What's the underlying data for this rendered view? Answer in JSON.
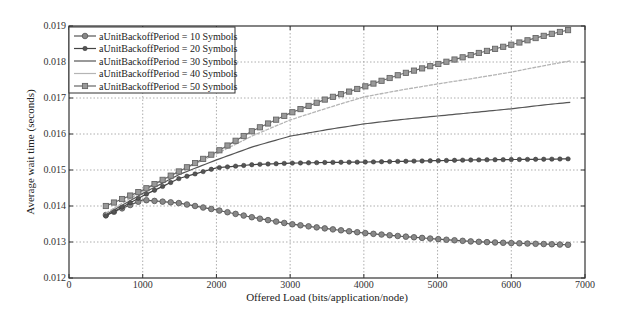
{
  "chart_data": {
    "type": "line",
    "title": "",
    "xlabel": "Offered Load (bits/application/node)",
    "ylabel": "Average wait time (seconds)",
    "xlim": [
      0,
      7000
    ],
    "ylim": [
      0.012,
      0.019
    ],
    "xticks": [
      "0",
      "1000",
      "2000",
      "3000",
      "4000",
      "5000",
      "6000",
      "7000"
    ],
    "yticks": [
      "0.012",
      "0.013",
      "0.014",
      "0.015",
      "0.016",
      "0.017",
      "0.018",
      "0.019"
    ],
    "grid": true,
    "legend_position": "top-left",
    "x": [
      500,
      1000,
      1500,
      2000,
      2500,
      3000,
      3500,
      4000,
      4500,
      5000,
      5500,
      6000,
      6500,
      6800
    ],
    "series": [
      {
        "name": "aUnitBackoffPeriod = 10 Symbols",
        "marker": "circle",
        "color": "#555555",
        "values": [
          0.01375,
          0.01417,
          0.01408,
          0.01389,
          0.01368,
          0.0135,
          0.01337,
          0.01325,
          0.01316,
          0.01308,
          0.01301,
          0.01297,
          0.01294,
          0.01292
        ]
      },
      {
        "name": "aUnitBackoffPeriod = 20 Symbols",
        "marker": "dot",
        "color": "#444444",
        "values": [
          0.01372,
          0.01428,
          0.01477,
          0.01506,
          0.01515,
          0.01519,
          0.01521,
          0.01522,
          0.01524,
          0.01526,
          0.01528,
          0.01529,
          0.0153,
          0.01531
        ]
      },
      {
        "name": "aUnitBackoffPeriod = 30 Symbols",
        "marker": "none",
        "color": "#555555",
        "values": [
          0.01376,
          0.01435,
          0.01488,
          0.01528,
          0.01565,
          0.01594,
          0.01612,
          0.01628,
          0.0164,
          0.0165,
          0.0166,
          0.0167,
          0.01682,
          0.01688
        ]
      },
      {
        "name": "aUnitBackoffPeriod = 40 Symbols",
        "marker": "none",
        "color": "#aaaaaa",
        "values": [
          0.0138,
          0.01442,
          0.01497,
          0.01545,
          0.01596,
          0.01639,
          0.01672,
          0.01703,
          0.01722,
          0.01739,
          0.01755,
          0.01772,
          0.01792,
          0.01803
        ]
      },
      {
        "name": "aUnitBackoffPeriod = 50 Symbols",
        "marker": "square",
        "color": "#666666",
        "values": [
          0.014,
          0.01444,
          0.01497,
          0.0155,
          0.0161,
          0.01658,
          0.01698,
          0.01731,
          0.01766,
          0.01794,
          0.01822,
          0.01848,
          0.01876,
          0.0189
        ]
      }
    ]
  }
}
